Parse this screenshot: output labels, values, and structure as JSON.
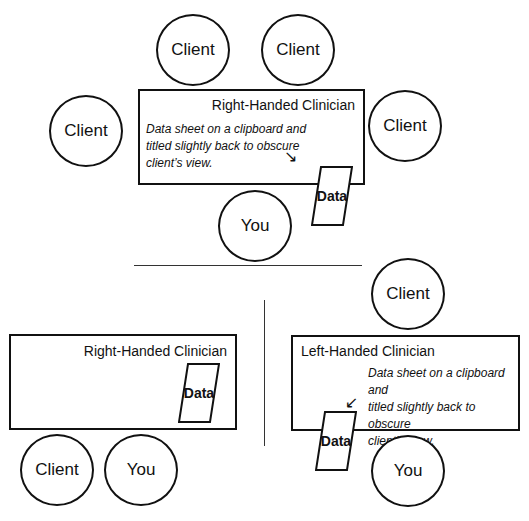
{
  "top_scene": {
    "table_title": "Right-Handed Clinician",
    "note": "Data sheet on a clipboard and titled slightly back to obscure client’s view.",
    "note_lines": [
      "Data sheet on a clipboard and",
      "titled slightly back to obscure",
      "client’s view."
    ],
    "arrow": "↘",
    "sheet_label": "Data",
    "clients": [
      "Client",
      "Client",
      "Client",
      "Client"
    ],
    "you": "You"
  },
  "bottom_left_scene": {
    "table_title": "Right-Handed Clinician",
    "sheet_label": "Data",
    "client": "Client",
    "you": "You"
  },
  "bottom_right_scene": {
    "table_title": "Left-Handed Clinician",
    "note_lines": [
      "Data sheet on a clipboard and",
      "titled slightly back to obscure",
      "client’s view."
    ],
    "arrow": "↙",
    "sheet_label": "Data",
    "client": "Client",
    "you": "You"
  },
  "colors": {
    "stroke": "#111111",
    "background": "#ffffff"
  }
}
